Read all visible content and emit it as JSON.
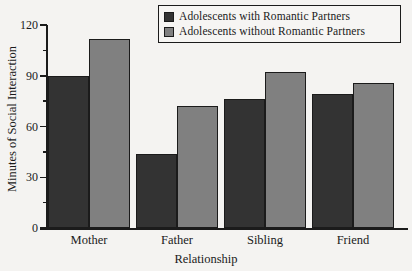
{
  "chart_data": {
    "type": "bar",
    "title": "",
    "xlabel": "Relationship",
    "ylabel": "Minutes of Social Interaction",
    "categories": [
      "Mother",
      "Father",
      "Sibling",
      "Friend"
    ],
    "series": [
      {
        "name": "Adolescents with Romantic Partners",
        "color": "#333333",
        "values": [
          90,
          44,
          76,
          79
        ]
      },
      {
        "name": "Adolescents without Romantic Partners",
        "color": "#808080",
        "values": [
          112,
          72,
          92,
          86
        ]
      }
    ],
    "ylim": [
      0,
      120
    ],
    "yticks": [
      0,
      30,
      60,
      90,
      120
    ],
    "ytick_labels": [
      "0",
      "30",
      "60",
      "90",
      "120"
    ],
    "yminor_ticks": [
      15,
      45,
      75,
      105
    ],
    "grid": false,
    "legend_position": "top-right"
  },
  "legend": {
    "items": [
      {
        "label": "Adolescents with Romantic Partners",
        "color": "#333333"
      },
      {
        "label": "Adolescents without Romantic Partners",
        "color": "#808080"
      }
    ]
  }
}
